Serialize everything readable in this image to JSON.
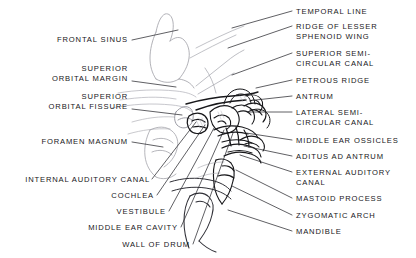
{
  "figure": {
    "kind": "anatomical-line-drawing",
    "ink_color": "#17171a",
    "background_color": "#ffffff",
    "leader_line_color": "#2b2b30"
  },
  "labels_left": [
    {
      "id": "frontal-sinus",
      "lines": [
        "FRONTAL SINUS"
      ],
      "x": 128,
      "y": 42,
      "leader": [
        [
          132,
          40
        ],
        [
          178,
          30
        ]
      ]
    },
    {
      "id": "superior-orbital-margin",
      "lines": [
        "SUPERIOR",
        "ORBITAL MARGIN"
      ],
      "x": 128,
      "y": 71,
      "leader": [
        [
          132,
          81
        ],
        [
          176,
          87
        ]
      ]
    },
    {
      "id": "superior-orbital-fissure",
      "lines": [
        "SUPERIOR",
        "ORBITAL FISSURE"
      ],
      "x": 128,
      "y": 99,
      "leader": [
        [
          132,
          109
        ],
        [
          182,
          115
        ]
      ]
    },
    {
      "id": "foramen-magnum",
      "lines": [
        "FORAMEN MAGNUM"
      ],
      "x": 128,
      "y": 144,
      "leader": [
        [
          132,
          142
        ],
        [
          163,
          147
        ]
      ]
    },
    {
      "id": "internal-auditory-canal",
      "lines": [
        "INTERNAL AUDITORY CANAL"
      ],
      "x": 150,
      "y": 182,
      "leader": [
        [
          152,
          179
        ],
        [
          196,
          122
        ]
      ]
    },
    {
      "id": "cochlea",
      "lines": [
        "COCHLEA"
      ],
      "x": 154,
      "y": 198,
      "leader": [
        [
          157,
          195
        ],
        [
          205,
          125
        ]
      ]
    },
    {
      "id": "vestibule",
      "lines": [
        "VESTIBULE"
      ],
      "x": 166,
      "y": 214,
      "leader": [
        [
          169,
          211
        ],
        [
          214,
          128
        ]
      ]
    },
    {
      "id": "middle-ear-cavity",
      "lines": [
        "MIDDLE EAR CAVITY"
      ],
      "x": 178,
      "y": 230,
      "leader": [
        [
          181,
          227
        ],
        [
          224,
          130
        ]
      ]
    },
    {
      "id": "wall-of-drum",
      "lines": [
        "WALL OF DRUM"
      ],
      "x": 190,
      "y": 247,
      "leader": [
        [
          193,
          244
        ],
        [
          233,
          133
        ]
      ]
    }
  ],
  "labels_right": [
    {
      "id": "temporal-line",
      "lines": [
        "TEMPORAL LINE"
      ],
      "x": 296,
      "y": 14,
      "leader": [
        [
          292,
          11
        ],
        [
          232,
          28
        ]
      ]
    },
    {
      "id": "ridge-of-lesser-sphenoid-wing",
      "lines": [
        "RIDGE OF LESSER",
        "SPHENOID WING"
      ],
      "x": 296,
      "y": 29,
      "leader": [
        [
          292,
          26
        ],
        [
          228,
          48
        ]
      ]
    },
    {
      "id": "superior-semicircular-canal",
      "lines": [
        "SUPERIOR SEMI-",
        "CIRCULAR CANAL"
      ],
      "x": 296,
      "y": 56,
      "leader": [
        [
          292,
          53
        ],
        [
          232,
          75
        ]
      ]
    },
    {
      "id": "petrous-ridge",
      "lines": [
        "PETROUS RIDGE"
      ],
      "x": 296,
      "y": 83,
      "leader": [
        [
          292,
          80
        ],
        [
          256,
          88
        ]
      ]
    },
    {
      "id": "antrum",
      "lines": [
        "ANTRUM"
      ],
      "x": 296,
      "y": 99,
      "leader": [
        [
          292,
          96
        ],
        [
          256,
          100
        ]
      ]
    },
    {
      "id": "lateral-semicircular-canal",
      "lines": [
        "LATERAL SEMI-",
        "CIRCULAR CANAL"
      ],
      "x": 296,
      "y": 115,
      "leader": [
        [
          292,
          112
        ],
        [
          248,
          112
        ]
      ]
    },
    {
      "id": "middle-ear-ossicles",
      "lines": [
        "MIDDLE EAR OSSICLES"
      ],
      "x": 296,
      "y": 143,
      "leader": [
        [
          292,
          140
        ],
        [
          246,
          133
        ]
      ]
    },
    {
      "id": "aditus-ad-antrum",
      "lines": [
        "ADITUS AD ANTRUM"
      ],
      "x": 296,
      "y": 159,
      "leader": [
        [
          292,
          156
        ],
        [
          244,
          146
        ]
      ]
    },
    {
      "id": "external-auditory-canal",
      "lines": [
        "EXTERNAL AUDITORY",
        "CANAL"
      ],
      "x": 296,
      "y": 175,
      "leader": [
        [
          292,
          172
        ],
        [
          240,
          155
        ]
      ]
    },
    {
      "id": "mastoid-process",
      "lines": [
        "MASTOID PROCESS"
      ],
      "x": 296,
      "y": 201,
      "leader": [
        [
          292,
          198
        ],
        [
          236,
          170
        ]
      ]
    },
    {
      "id": "zygomatic-arch",
      "lines": [
        "ZYGOMATIC ARCH"
      ],
      "x": 296,
      "y": 218,
      "leader": [
        [
          292,
          215
        ],
        [
          232,
          186
        ]
      ]
    },
    {
      "id": "mandible",
      "lines": [
        "MANDIBLE"
      ],
      "x": 296,
      "y": 234,
      "leader": [
        [
          292,
          231
        ],
        [
          228,
          210
        ]
      ]
    }
  ]
}
